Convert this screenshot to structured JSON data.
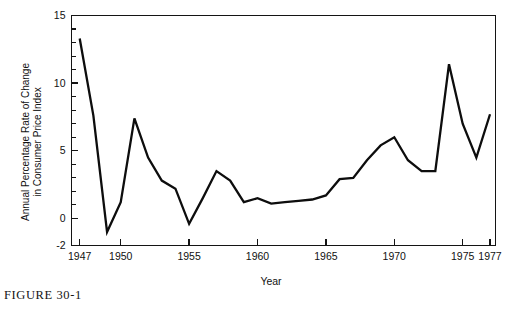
{
  "figure": {
    "caption": "FIGURE 30-1"
  },
  "chart_data": {
    "type": "line",
    "title": "",
    "subtitle": "",
    "xlabel": "Year",
    "ylabel_line1": "Annual Percentage Rate of Change",
    "ylabel_line2": "in Consumer Price Index",
    "xlim": [
      1946.4,
      1977.4
    ],
    "ylim": [
      -2,
      15
    ],
    "grid": false,
    "legend": null,
    "x_ticks_major": [
      1947,
      1950,
      1955,
      1960,
      1965,
      1970,
      1975,
      1977
    ],
    "x_tick_labels": [
      "1947",
      "1950",
      "1955",
      "1960",
      "1965",
      "1970",
      "1975",
      "1977"
    ],
    "y_ticks_major": [
      -2,
      0,
      5,
      10,
      15
    ],
    "y_tick_labels": [
      "-2",
      "0",
      "5",
      "10",
      "15"
    ],
    "y_ticks_minor": [
      1,
      2,
      3,
      4,
      6,
      7,
      8,
      9,
      11,
      12,
      13,
      14
    ],
    "line_color": "#0d0d0d",
    "x": [
      1947,
      1948,
      1949,
      1950,
      1951,
      1952,
      1953,
      1954,
      1955,
      1956,
      1957,
      1958,
      1959,
      1960,
      1961,
      1962,
      1963,
      1964,
      1965,
      1966,
      1967,
      1968,
      1969,
      1970,
      1971,
      1972,
      1973,
      1974,
      1975,
      1976,
      1977
    ],
    "values": [
      13.3,
      7.6,
      -1.0,
      1.2,
      7.4,
      4.5,
      2.8,
      2.2,
      -0.4,
      1.5,
      3.5,
      2.8,
      1.2,
      1.5,
      1.1,
      1.2,
      1.3,
      1.4,
      1.7,
      2.9,
      3.0,
      4.3,
      5.4,
      6.0,
      4.3,
      3.5,
      3.5,
      11.4,
      7.0,
      4.5,
      7.7
    ],
    "annotations": []
  }
}
